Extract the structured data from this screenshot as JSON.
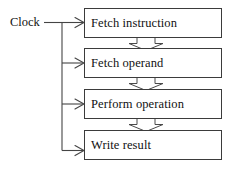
{
  "diagram": {
    "type": "flow-diagram",
    "colors": {
      "background": "#ffffff",
      "box_border": "#3b3b3b",
      "line": "#444444",
      "text": "#111111"
    },
    "clock": {
      "label": "Clock"
    },
    "stages": [
      {
        "id": "fetch-instruction",
        "label": "Fetch instruction",
        "x": 84,
        "y": 8,
        "width": 138,
        "height": 30
      },
      {
        "id": "fetch-operand",
        "label": "Fetch operand",
        "x": 84,
        "y": 48,
        "width": 138,
        "height": 30
      },
      {
        "id": "perform-operation",
        "label": "Perform operation",
        "x": 84,
        "y": 89,
        "width": 138,
        "height": 30
      },
      {
        "id": "write-result",
        "label": "Write result",
        "x": 84,
        "y": 130,
        "width": 138,
        "height": 30
      }
    ],
    "clock_arrow_targets": [
      "fetch-instruction",
      "fetch-operand",
      "perform-operation",
      "write-result"
    ],
    "flow_connectors": [
      {
        "from": "fetch-instruction",
        "to": "fetch-operand"
      },
      {
        "from": "fetch-operand",
        "to": "perform-operation"
      },
      {
        "from": "perform-operation",
        "to": "write-result"
      }
    ]
  }
}
